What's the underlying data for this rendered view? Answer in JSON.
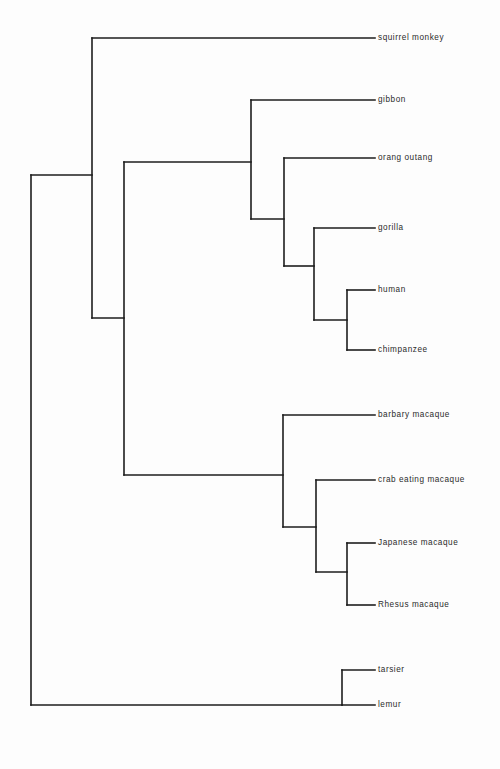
{
  "diagram": {
    "type": "cladogram",
    "orientation": "left-to-right",
    "line_color": "#1d1d1d",
    "background_color": "#fdfdfd",
    "label_color": "#2b2b2b"
  },
  "taxa": [
    {
      "id": "squirrel-monkey",
      "label": "squirrel monkey",
      "tip_y": 38,
      "label_x": 378,
      "tip_x": 375
    },
    {
      "id": "gibbon",
      "label": "gibbon",
      "tip_y": 100,
      "label_x": 378,
      "tip_x": 375
    },
    {
      "id": "orang-outang",
      "label": "orang outang",
      "tip_y": 158,
      "label_x": 378,
      "tip_x": 375
    },
    {
      "id": "gorilla",
      "label": "gorilla",
      "tip_y": 228,
      "label_x": 378,
      "tip_x": 375
    },
    {
      "id": "human",
      "label": "human",
      "tip_y": 290,
      "label_x": 378,
      "tip_x": 375
    },
    {
      "id": "chimpanzee",
      "label": "chimpanzee",
      "tip_y": 350,
      "label_x": 378,
      "tip_x": 375
    },
    {
      "id": "barbary-macaque",
      "label": "barbary macaque",
      "tip_y": 415,
      "label_x": 378,
      "tip_x": 375
    },
    {
      "id": "crab-eating-macaque",
      "label": "crab eating macaque",
      "tip_y": 480,
      "label_x": 378,
      "tip_x": 375
    },
    {
      "id": "japanese-macaque",
      "label": "Japanese macaque",
      "tip_y": 543,
      "label_x": 378,
      "tip_x": 375
    },
    {
      "id": "rhesus-macaque",
      "label": "Rhesus macaque",
      "tip_y": 605,
      "label_x": 378,
      "tip_x": 375
    },
    {
      "id": "tarsier",
      "label": "tarsier",
      "tip_y": 670,
      "label_x": 378,
      "tip_x": 375
    },
    {
      "id": "lemur",
      "label": "lemur",
      "tip_y": 705,
      "label_x": 378,
      "tip_x": 375
    }
  ],
  "nodes": [
    {
      "id": "root",
      "x": 31,
      "y_top": 175,
      "y_bottom": 705,
      "parent_x": 31,
      "parent_y": 175
    },
    {
      "id": "anthropoidea",
      "x": 92,
      "y_top": 38,
      "y_bottom": 318,
      "parent_x": 31,
      "parent_y": 175
    },
    {
      "id": "catarrhini",
      "x": 124,
      "y_top": 162,
      "y_bottom": 475,
      "parent_x": 92,
      "parent_y": 318
    },
    {
      "id": "hominoidea",
      "x": 251,
      "y_top": 100,
      "y_bottom": 219,
      "parent_x": 124,
      "parent_y": 162
    },
    {
      "id": "hominidae",
      "x": 284,
      "y_top": 158,
      "y_bottom": 266,
      "parent_x": 251,
      "parent_y": 219
    },
    {
      "id": "homininae",
      "x": 314,
      "y_top": 228,
      "y_bottom": 320,
      "parent_x": 284,
      "parent_y": 266
    },
    {
      "id": "hominini",
      "x": 347,
      "y_top": 290,
      "y_bottom": 350,
      "parent_x": 314,
      "parent_y": 320
    },
    {
      "id": "cercopithecidae",
      "x": 283,
      "y_top": 415,
      "y_bottom": 527,
      "parent_x": 124,
      "parent_y": 475
    },
    {
      "id": "macaca-group",
      "x": 316,
      "y_top": 480,
      "y_bottom": 572,
      "parent_x": 283,
      "parent_y": 527
    },
    {
      "id": "macaca-pair",
      "x": 347,
      "y_top": 543,
      "y_bottom": 605,
      "parent_x": 316,
      "parent_y": 572
    },
    {
      "id": "strepsirrhini",
      "x": 342,
      "y_top": 670,
      "y_bottom": 705,
      "parent_x": 31,
      "parent_y": 705
    }
  ],
  "tip_branches": [
    {
      "taxon": "squirrel-monkey",
      "from_x": 92,
      "y": 38
    },
    {
      "taxon": "gibbon",
      "from_x": 251,
      "y": 100
    },
    {
      "taxon": "orang-outang",
      "from_x": 284,
      "y": 158
    },
    {
      "taxon": "gorilla",
      "from_x": 314,
      "y": 228
    },
    {
      "taxon": "human",
      "from_x": 347,
      "y": 290
    },
    {
      "taxon": "chimpanzee",
      "from_x": 347,
      "y": 350
    },
    {
      "taxon": "barbary-macaque",
      "from_x": 283,
      "y": 415
    },
    {
      "taxon": "crab-eating-macaque",
      "from_x": 316,
      "y": 480
    },
    {
      "taxon": "japanese-macaque",
      "from_x": 347,
      "y": 543
    },
    {
      "taxon": "rhesus-macaque",
      "from_x": 347,
      "y": 605
    },
    {
      "taxon": "tarsier",
      "from_x": 342,
      "y": 670
    },
    {
      "taxon": "lemur",
      "from_x": 342,
      "y": 705
    }
  ]
}
